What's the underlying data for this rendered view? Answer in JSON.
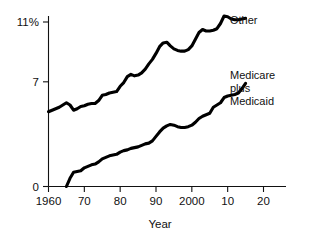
{
  "chart_data": {
    "type": "line",
    "title": "",
    "xlabel": "Year",
    "ylabel": "",
    "xlim": [
      1960,
      2020
    ],
    "ylim": [
      0,
      11.8
    ],
    "grid": false,
    "legend_position": "right-inline",
    "x_tick_labels": [
      "1960",
      "70",
      "80",
      "90",
      "2000",
      "10",
      "20"
    ],
    "x_tick_values": [
      1960,
      1970,
      1980,
      1990,
      2000,
      2010,
      2020
    ],
    "y_tick_labels": [
      "11%",
      "7",
      "0"
    ],
    "y_tick_values": [
      11,
      7,
      0
    ],
    "series": [
      {
        "name": "Other",
        "label": "Other",
        "color": "#000000",
        "x": [
          1960,
          1961,
          1962,
          1963,
          1964,
          1965,
          1966,
          1967,
          1968,
          1969,
          1970,
          1971,
          1972,
          1973,
          1974,
          1975,
          1976,
          1977,
          1978,
          1979,
          1980,
          1981,
          1982,
          1983,
          1984,
          1985,
          1986,
          1987,
          1988,
          1989,
          1990,
          1991,
          1992,
          1993,
          1994,
          1995,
          1996,
          1997,
          1998,
          1999,
          2000,
          2001,
          2002,
          2003,
          2004,
          2005,
          2006,
          2007,
          2008,
          2009,
          2010,
          2011,
          2012,
          2013,
          2014,
          2015
        ],
        "values": [
          5.0,
          5.1,
          5.2,
          5.3,
          5.45,
          5.6,
          5.45,
          5.1,
          5.2,
          5.35,
          5.4,
          5.5,
          5.55,
          5.55,
          5.75,
          6.1,
          6.15,
          6.25,
          6.3,
          6.35,
          6.7,
          6.95,
          7.35,
          7.5,
          7.4,
          7.45,
          7.6,
          7.85,
          8.2,
          8.5,
          8.9,
          9.35,
          9.6,
          9.65,
          9.4,
          9.2,
          9.1,
          9.05,
          9.05,
          9.15,
          9.4,
          9.85,
          10.3,
          10.5,
          10.4,
          10.4,
          10.45,
          10.55,
          10.9,
          11.4,
          11.35,
          11.2,
          11.15,
          11.15,
          11.2,
          11.25
        ]
      },
      {
        "name": "Medicare plus Medicaid",
        "label": "Medicare\nplus\nMedicaid",
        "color": "#000000",
        "x": [
          1965,
          1966,
          1967,
          1968,
          1969,
          1970,
          1971,
          1972,
          1973,
          1974,
          1975,
          1976,
          1977,
          1978,
          1979,
          1980,
          1981,
          1982,
          1983,
          1984,
          1985,
          1986,
          1987,
          1988,
          1989,
          1990,
          1991,
          1992,
          1993,
          1994,
          1995,
          1996,
          1997,
          1998,
          1999,
          2000,
          2001,
          2002,
          2003,
          2004,
          2005,
          2006,
          2007,
          2008,
          2009,
          2010,
          2011,
          2012,
          2013,
          2014,
          2015
        ],
        "values": [
          0.0,
          0.55,
          0.95,
          1.0,
          1.05,
          1.25,
          1.35,
          1.45,
          1.5,
          1.65,
          1.85,
          1.95,
          2.05,
          2.1,
          2.15,
          2.3,
          2.4,
          2.45,
          2.55,
          2.6,
          2.65,
          2.75,
          2.85,
          2.9,
          3.05,
          3.35,
          3.65,
          3.9,
          4.05,
          4.15,
          4.1,
          4.0,
          3.95,
          3.95,
          4.0,
          4.1,
          4.3,
          4.55,
          4.7,
          4.8,
          4.9,
          5.3,
          5.45,
          5.6,
          5.95,
          6.05,
          6.1,
          6.15,
          6.25,
          6.55,
          6.9
        ]
      }
    ],
    "annotations": [
      {
        "name": "other-label",
        "text": "Other",
        "x_px": 230,
        "y_px": 20
      },
      {
        "name": "medicare-label-line1",
        "text": "Medicare",
        "x_px": 230,
        "y_px": 75
      },
      {
        "name": "medicare-label-line2",
        "text": "plus",
        "x_px": 230,
        "y_px": 88
      },
      {
        "name": "medicare-label-line3",
        "text": "Medicaid",
        "x_px": 230,
        "y_px": 101
      }
    ]
  },
  "axes": {
    "x_axis_label": "Year"
  },
  "colors": {
    "line": "#000000",
    "axis": "#111111",
    "background": "#ffffff"
  }
}
